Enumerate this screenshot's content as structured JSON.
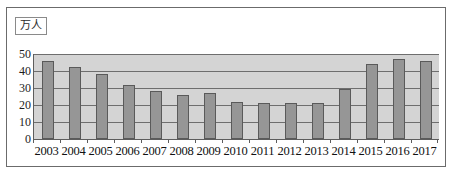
{
  "figure": {
    "unit_label": "万人"
  },
  "chart_data": {
    "type": "bar",
    "title": "",
    "subtitle": "",
    "xlabel": "",
    "ylabel": "万人",
    "categories": [
      "2003",
      "2004",
      "2005",
      "2006",
      "2007",
      "2008",
      "2009",
      "2010",
      "2011",
      "2012",
      "2013",
      "2014",
      "2015",
      "2016",
      "2017"
    ],
    "values": [
      46,
      42.5,
      38,
      32,
      28,
      26,
      27,
      22,
      21,
      21,
      21,
      29.5,
      44,
      47,
      46
    ],
    "series": [
      {
        "name": "人数",
        "values": [
          46,
          42.5,
          38,
          32,
          28,
          26,
          27,
          22,
          21,
          21,
          21,
          29.5,
          44,
          47,
          46
        ]
      }
    ],
    "ylim": [
      0,
      50
    ],
    "ytick_labels": [
      "50",
      "40",
      "30",
      "20",
      "10",
      "0"
    ],
    "ytick_values": [
      50,
      40,
      30,
      20,
      10,
      0
    ],
    "grid": true,
    "legend": false,
    "legend_position": "none",
    "bar_color": "#969696",
    "plot_background": "#d4d4d4",
    "axis_color": "#5d5d5d"
  }
}
